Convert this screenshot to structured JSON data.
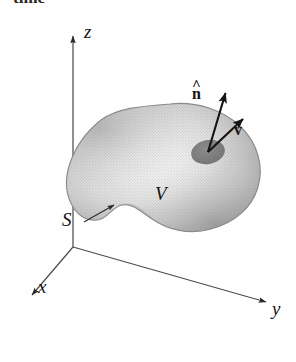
{
  "figure": {
    "background_color": "#ffffff",
    "ink_color": "#15130f"
  },
  "caption": {
    "cropped_text": "time"
  },
  "axes": {
    "z": {
      "label": "z",
      "label_x": 84,
      "label_y": 32,
      "tip_x": 73,
      "tip_y": 29,
      "origin_x": 73,
      "origin_y": 247
    },
    "y": {
      "label": "y",
      "label_x": 276,
      "label_y": 310,
      "tip_x": 274,
      "tip_y": 305,
      "origin_x": 73,
      "origin_y": 247
    },
    "x": {
      "label": "x",
      "label_x": 40,
      "label_y": 288,
      "tip_x": 26,
      "tip_y": 299,
      "origin_x": 73,
      "origin_y": 247
    }
  },
  "volume": {
    "label": "V",
    "label_x": 160,
    "label_y": 195,
    "fill_light": "#fbfbfb",
    "fill_mid": "#d2d2d2",
    "fill_dark": "#9a9a9a",
    "outline_color": "#8c8c8c"
  },
  "surface": {
    "label": "S",
    "label_x": 64,
    "label_y": 222,
    "leader_from_x": 84,
    "leader_from_y": 222,
    "leader_to_x": 117,
    "leader_to_y": 203
  },
  "patch": {
    "name": "surface-element-dA",
    "center_x": 208,
    "center_y": 152,
    "radius_x": 17,
    "radius_y": 12,
    "rotation_deg": -12,
    "fill": "#7c7c7c"
  },
  "vectors": [
    {
      "id": "normal",
      "label": "n",
      "accent": "^",
      "has_hat": true,
      "label_x": 196,
      "label_y": 95,
      "from_x": 208,
      "from_y": 152,
      "to_x": 229,
      "to_y": 85,
      "color": "#15130f"
    },
    {
      "id": "velocity",
      "label": "v",
      "accent": "",
      "has_hat": false,
      "label_x": 236,
      "label_y": 130,
      "from_x": 208,
      "from_y": 152,
      "to_x": 251,
      "to_y": 112,
      "color": "#15130f"
    }
  ]
}
